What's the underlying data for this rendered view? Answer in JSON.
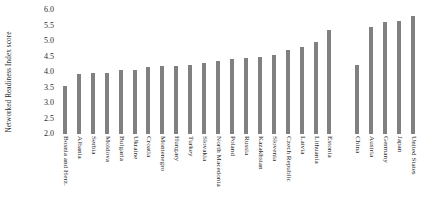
{
  "chart_data": {
    "type": "bar",
    "title": "",
    "xlabel": "",
    "ylabel": "Networked Readiness Index score",
    "ylim": [
      2.0,
      6.0
    ],
    "ytick_labels": [
      "6.0",
      "5.5",
      "5.0",
      "4.5",
      "4.0",
      "3.5",
      "3.0",
      "2.5",
      "2.0"
    ],
    "ytick_values": [
      6.0,
      5.5,
      5.0,
      4.5,
      4.0,
      3.5,
      3.0,
      2.5,
      2.0
    ],
    "grid": false,
    "legend": "none",
    "bar_color": "#808080",
    "categories": [
      "Bosnia and Herz.",
      "Albania",
      "Serbia",
      "Moldova",
      "Bulgaria",
      "Ukraine",
      "Croatia",
      "Montenegro",
      "Hungary",
      "Turkey",
      "Slovakia",
      "North Macedonia",
      "Poland",
      "Russia",
      "Kazakhstan",
      "Slovenia",
      "Czech Republic",
      "Latvia",
      "Lithuania",
      "Estonia",
      "",
      "China",
      "Austria",
      "Germany",
      "Japan",
      "United States"
    ],
    "values": [
      3.55,
      3.95,
      3.98,
      3.97,
      4.05,
      4.07,
      4.15,
      4.18,
      4.2,
      4.22,
      4.3,
      4.35,
      4.42,
      4.45,
      4.5,
      4.55,
      4.72,
      4.82,
      4.97,
      5.35,
      null,
      4.22,
      5.45,
      5.6,
      5.65,
      5.8
    ]
  }
}
